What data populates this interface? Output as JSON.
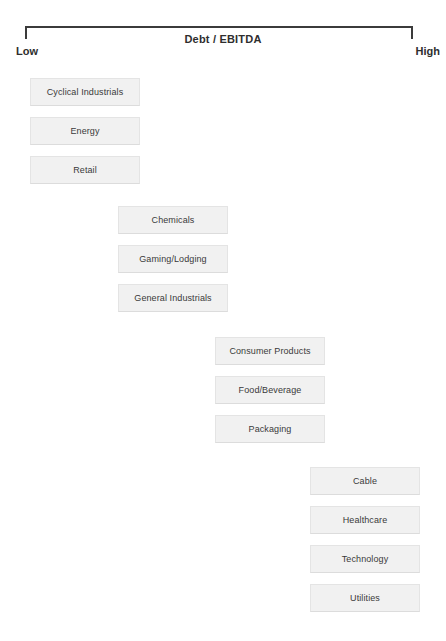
{
  "header": {
    "axis_title": "Debt / EBITDA",
    "low_label": "Low",
    "high_label": "High"
  },
  "colors": {
    "box_fill": "#f1f1f1",
    "box_border": "#e4e4e4",
    "box_shadow": "#b6b6b6",
    "text": "#3a3a3a",
    "axis_line": "#3b3b3b",
    "axis_text": "#2e2e2e",
    "background": "#ffffff"
  },
  "chart_data": {
    "type": "bar",
    "title": "Debt / EBITDA",
    "xlabel": "Debt / EBITDA",
    "ylabel": "",
    "orientation": "horizontal",
    "axis_endpoints": [
      "Low",
      "High"
    ],
    "groups": [
      {
        "group_index": 1,
        "leverage_level": "Low",
        "x": 30,
        "categories": [
          "Cyclical Industrials",
          "Energy",
          "Retail"
        ]
      },
      {
        "group_index": 2,
        "leverage_level": "Low-Moderate",
        "x": 118,
        "categories": [
          "Chemicals",
          "Gaming/Lodging",
          "General Industrials"
        ]
      },
      {
        "group_index": 3,
        "leverage_level": "Moderate-High",
        "x": 215,
        "categories": [
          "Consumer Products",
          "Food/Beverage",
          "Packaging"
        ]
      },
      {
        "group_index": 4,
        "leverage_level": "High",
        "x": 310,
        "categories": [
          "Cable",
          "Healthcare",
          "Technology",
          "Utilities"
        ]
      }
    ],
    "categories": [
      "Cyclical Industrials",
      "Energy",
      "Retail",
      "Chemicals",
      "Gaming/Lodging",
      "General Industrials",
      "Consumer Products",
      "Food/Beverage",
      "Packaging",
      "Cable",
      "Healthcare",
      "Technology",
      "Utilities"
    ]
  },
  "boxes": [
    {
      "label": "Cyclical Industrials",
      "x": 30,
      "y": 78,
      "group": 1
    },
    {
      "label": "Energy",
      "x": 30,
      "y": 117,
      "group": 1
    },
    {
      "label": "Retail",
      "x": 30,
      "y": 156,
      "group": 1
    },
    {
      "label": "Chemicals",
      "x": 118,
      "y": 206,
      "group": 2
    },
    {
      "label": "Gaming/Lodging",
      "x": 118,
      "y": 245,
      "group": 2
    },
    {
      "label": "General Industrials",
      "x": 118,
      "y": 284,
      "group": 2
    },
    {
      "label": "Consumer Products",
      "x": 215,
      "y": 337,
      "group": 3
    },
    {
      "label": "Food/Beverage",
      "x": 215,
      "y": 376,
      "group": 3
    },
    {
      "label": "Packaging",
      "x": 215,
      "y": 415,
      "group": 3
    },
    {
      "label": "Cable",
      "x": 310,
      "y": 467,
      "group": 4
    },
    {
      "label": "Healthcare",
      "x": 310,
      "y": 506,
      "group": 4
    },
    {
      "label": "Technology",
      "x": 310,
      "y": 545,
      "group": 4
    },
    {
      "label": "Utilities",
      "x": 310,
      "y": 584,
      "group": 4
    }
  ]
}
